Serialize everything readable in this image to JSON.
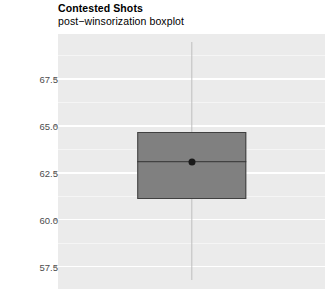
{
  "chart_data": {
    "type": "boxplot",
    "title": "Contested Shots",
    "subtitle": "post−winsorization boxplot",
    "xlabel": "",
    "ylabel": "",
    "grid": true,
    "legend": "none",
    "ylim": [
      56.3,
      69.9
    ],
    "yticks": [
      67.5,
      65.0,
      62.5,
      60.0,
      57.5
    ],
    "ytick_labels": [
      "67.5",
      "65.0",
      "62.5",
      "60.0",
      "57.5"
    ],
    "categories": [
      "Contested Shots"
    ],
    "series": [
      {
        "name": "Contested Shots",
        "whisker_low": 56.8,
        "q1": 61.1,
        "median": 63.1,
        "q3": 64.7,
        "whisker_high": 69.5,
        "mean": 63.1,
        "outliers": []
      }
    ],
    "colors": {
      "panel_background": "#ebebeb",
      "gridline_major": "#ffffff",
      "gridline_minor": "#f5f5f5",
      "box_fill": "#808080",
      "box_border": "#404040",
      "median_line": "#333333",
      "whisker": "#bfbfbf",
      "mean_point": "#1a1a1a",
      "tick_label": "#4d4d4d",
      "title_text": "#000000"
    }
  }
}
